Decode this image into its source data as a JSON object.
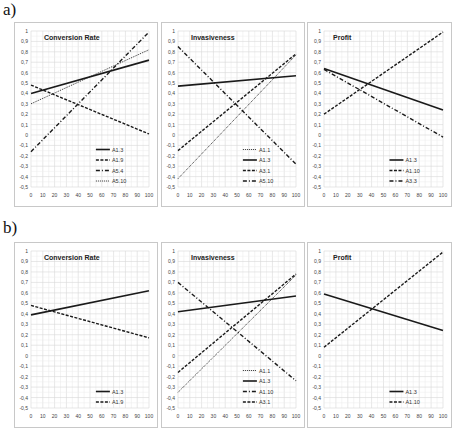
{
  "rows": [
    {
      "label": "a)"
    },
    {
      "label": "b)"
    }
  ],
  "axis": {
    "x_ticks": [
      "0",
      "10",
      "20",
      "30",
      "40",
      "50",
      "60",
      "70",
      "80",
      "90",
      "100"
    ],
    "y_ticks": [
      "1",
      "0,9",
      "0,8",
      "0,7",
      "0,6",
      "0,5",
      "0,4",
      "0,3",
      "0,2",
      "0,1",
      "0",
      "-0,1",
      "-0,2",
      "-0,3",
      "-0,4",
      "-0,5"
    ]
  },
  "chart_data": [
    {
      "panel": "a",
      "type": "line",
      "title": "Conversion Rate",
      "x": [
        0,
        100
      ],
      "xlim": [
        0,
        100
      ],
      "ylim": [
        -0.5,
        1
      ],
      "grid": true,
      "legend_position": "lower right",
      "series": [
        {
          "name": "A1.3",
          "style": "solid",
          "values": [
            0.4,
            0.72
          ]
        },
        {
          "name": "A1.9",
          "style": "dashed",
          "values": [
            0.48,
            0.01
          ]
        },
        {
          "name": "A5.4",
          "style": "dashdot",
          "values": [
            -0.16,
            0.99
          ]
        },
        {
          "name": "A5.10",
          "style": "dotted",
          "values": [
            0.3,
            0.82
          ]
        }
      ]
    },
    {
      "panel": "a",
      "type": "line",
      "title": "Invasiveness",
      "x": [
        0,
        100
      ],
      "xlim": [
        0,
        100
      ],
      "ylim": [
        -0.5,
        1
      ],
      "grid": true,
      "legend_position": "lower right",
      "series": [
        {
          "name": "A1.1",
          "style": "dotted",
          "values": [
            -0.42,
            0.77
          ]
        },
        {
          "name": "A1.3",
          "style": "solid",
          "values": [
            0.47,
            0.57
          ]
        },
        {
          "name": "A3.1",
          "style": "dashed",
          "values": [
            -0.15,
            0.78
          ]
        },
        {
          "name": "A5.10",
          "style": "dashdot",
          "values": [
            0.85,
            -0.28
          ]
        }
      ]
    },
    {
      "panel": "a",
      "type": "line",
      "title": "Profit",
      "x": [
        0,
        100
      ],
      "xlim": [
        0,
        100
      ],
      "ylim": [
        -0.5,
        1
      ],
      "grid": true,
      "legend_position": "lower right",
      "series": [
        {
          "name": "A1.3",
          "style": "solid",
          "values": [
            0.64,
            0.24
          ]
        },
        {
          "name": "A1.10",
          "style": "dashed",
          "values": [
            0.2,
            0.99
          ]
        },
        {
          "name": "A3.3",
          "style": "dashdot",
          "values": [
            0.63,
            -0.02
          ]
        }
      ]
    },
    {
      "panel": "b",
      "type": "line",
      "title": "Conversion Rate",
      "x": [
        0,
        100
      ],
      "xlim": [
        0,
        100
      ],
      "ylim": [
        -0.5,
        1
      ],
      "grid": true,
      "legend_position": "lower right",
      "series": [
        {
          "name": "A1.3",
          "style": "solid",
          "values": [
            0.39,
            0.62
          ]
        },
        {
          "name": "A1.9",
          "style": "dashed",
          "values": [
            0.48,
            0.17
          ]
        }
      ]
    },
    {
      "panel": "b",
      "type": "line",
      "title": "Invasiveness",
      "x": [
        0,
        100
      ],
      "xlim": [
        0,
        100
      ],
      "ylim": [
        -0.5,
        1
      ],
      "grid": true,
      "legend_position": "lower right",
      "series": [
        {
          "name": "A1.1",
          "style": "dotted",
          "values": [
            -0.35,
            0.77
          ]
        },
        {
          "name": "A1.3",
          "style": "solid",
          "values": [
            0.42,
            0.57
          ]
        },
        {
          "name": "A1.10",
          "style": "dashdot",
          "values": [
            0.7,
            -0.24
          ]
        },
        {
          "name": "A3.1",
          "style": "dashed",
          "values": [
            -0.16,
            0.78
          ]
        }
      ]
    },
    {
      "panel": "b",
      "type": "line",
      "title": "Profit",
      "x": [
        0,
        100
      ],
      "xlim": [
        0,
        100
      ],
      "ylim": [
        -0.5,
        1
      ],
      "grid": true,
      "legend_position": "lower right",
      "series": [
        {
          "name": "A1.3",
          "style": "solid",
          "values": [
            0.59,
            0.24
          ]
        },
        {
          "name": "A1.10",
          "style": "dashed",
          "values": [
            0.08,
            0.99
          ]
        }
      ]
    }
  ]
}
